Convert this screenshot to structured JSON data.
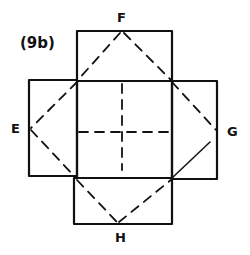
{
  "figure": {
    "label": "(9b)"
  },
  "vertices": {
    "top": "F",
    "left": "E",
    "right": "G",
    "bottom": "H"
  },
  "colors": {
    "ink": "#111111",
    "background": "#ffffff"
  }
}
